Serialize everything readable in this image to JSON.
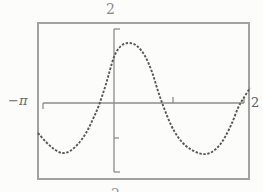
{
  "chart_data": {
    "type": "line",
    "title": "",
    "window_labels": {
      "top": "2",
      "left": "−π",
      "right": "2",
      "bottom": "2"
    },
    "xlabel": "",
    "ylabel": "",
    "ylim_label": [
      -2,
      2
    ],
    "grid": false,
    "legend": "none",
    "frame_px": {
      "left": 37,
      "top": 22,
      "width": 213,
      "height": 158
    },
    "axes_px": {
      "x_axis": {
        "y": 103,
        "x1": 43,
        "x2": 244,
        "serif_left_dir": "down",
        "serif_right_dir": "up",
        "serif_len": 6,
        "ticks": [
          {
            "x": 173,
            "dir": "up",
            "len": 6
          }
        ]
      },
      "y_axis": {
        "x": 114,
        "y1": 29,
        "y2": 172,
        "serif_top_dir": "right",
        "serif_bottom_dir": "right",
        "serif_len": 6,
        "ticks": [
          {
            "y": 138,
            "dir": "right",
            "len": 5
          }
        ]
      }
    },
    "series": [
      {
        "name": "sinusoid",
        "style": "dotted-scan",
        "points_px": [
          [
            38,
            133
          ],
          [
            46,
            142
          ],
          [
            54,
            149
          ],
          [
            62,
            153
          ],
          [
            70,
            151
          ],
          [
            78,
            144
          ],
          [
            86,
            133
          ],
          [
            93,
            119
          ],
          [
            99,
            105
          ],
          [
            106,
            84
          ],
          [
            114,
            57
          ],
          [
            121,
            46
          ],
          [
            129,
            43
          ],
          [
            137,
            46
          ],
          [
            145,
            56
          ],
          [
            152,
            72
          ],
          [
            158,
            91
          ],
          [
            164,
            108
          ],
          [
            171,
            125
          ],
          [
            178,
            137
          ],
          [
            186,
            146
          ],
          [
            194,
            151
          ],
          [
            202,
            154
          ],
          [
            210,
            153
          ],
          [
            218,
            147
          ],
          [
            225,
            137
          ],
          [
            232,
            123
          ],
          [
            238,
            108
          ],
          [
            243,
            99
          ],
          [
            250,
            88
          ]
        ]
      }
    ],
    "colors": {
      "curve": "#565652",
      "axis": "#8d8d89",
      "frame": "#a2a29e",
      "background": "#fcfcfa"
    }
  }
}
